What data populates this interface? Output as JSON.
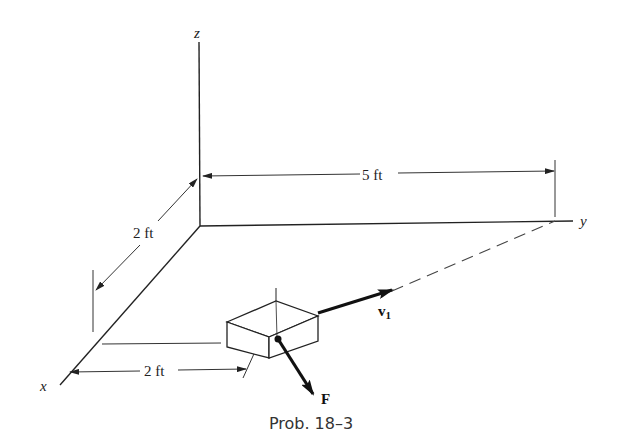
{
  "axes": {
    "x_label": "x",
    "y_label": "y",
    "z_label": "z"
  },
  "dimensions": {
    "y_span": "5 ft",
    "x_span": "2 ft",
    "block_offset": "2 ft"
  },
  "vectors": {
    "velocity_label": "v",
    "velocity_subscript": "1",
    "force_label": "F"
  },
  "caption": "Prob. 18–3",
  "colors": {
    "ink": "#222222",
    "background": "#ffffff"
  }
}
